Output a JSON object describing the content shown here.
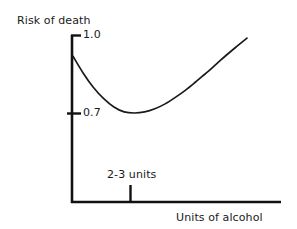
{
  "chart_data": {
    "type": "line",
    "title": "",
    "subtitle": "",
    "xlabel": "Units of alcohol",
    "ylabel": "Risk of death",
    "grid": false,
    "legend": false,
    "legend_position": "none",
    "curve_name": "J-shaped risk curve",
    "annotations": [
      {
        "name": "x-axis-tick-annotation",
        "text": "2-3 units",
        "axis": "x",
        "at": "2-3 units"
      }
    ],
    "y_ticks": [
      {
        "label": "1.0",
        "value": 1.0
      },
      {
        "label": "0.7",
        "value": 0.7
      }
    ],
    "x_ticks": [
      {
        "label": "2-3 units",
        "value": 2.5
      }
    ],
    "ylim": [
      0,
      1.0
    ],
    "xlim": [
      0,
      10
    ],
    "x": [
      0.0,
      0.5,
      1.0,
      1.5,
      2.0,
      2.5,
      3.0,
      3.5,
      4.0,
      4.5,
      5.0,
      5.5,
      6.0,
      6.5,
      7.0,
      7.5,
      8.0,
      8.5
    ],
    "values": [
      0.92,
      0.855,
      0.8,
      0.757,
      0.725,
      0.706,
      0.702,
      0.706,
      0.718,
      0.737,
      0.762,
      0.79,
      0.822,
      0.855,
      0.89,
      0.925,
      0.958,
      0.99
    ],
    "series": [
      {
        "name": "Risk of death vs units of alcohol",
        "values": [
          0.92,
          0.855,
          0.8,
          0.757,
          0.725,
          0.706,
          0.702,
          0.706,
          0.718,
          0.737,
          0.762,
          0.79,
          0.822,
          0.855,
          0.89,
          0.925,
          0.958,
          0.99
        ]
      }
    ],
    "colors": {
      "curve": "#1a1a1a",
      "axis": "#111111",
      "text": "#1a1a1a",
      "background": "#ffffff"
    }
  },
  "labels": {
    "y_axis": "Risk of death",
    "x_axis": "Units of alcohol",
    "y_tick_top": "1.0",
    "y_tick_mid": "0.7",
    "x_tick": "2-3 units"
  }
}
